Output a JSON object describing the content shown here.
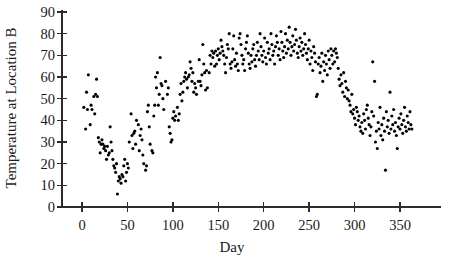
{
  "chart_data": {
    "type": "scatter",
    "title": "",
    "xlabel": "Day",
    "ylabel": "Temperature at Location B",
    "xlim": [
      -8,
      372
    ],
    "ylim": [
      0,
      93
    ],
    "grid": false,
    "legend": null,
    "marker": {
      "shape": "circle",
      "color": "#000000",
      "size_px": 3.1
    },
    "xticks": [
      0,
      50,
      100,
      150,
      200,
      250,
      300,
      350
    ],
    "xtick_labels": [
      "0",
      "50",
      "100",
      "150",
      "200",
      "250",
      "300",
      "350"
    ],
    "yticks": [
      0,
      10,
      20,
      30,
      40,
      50,
      60,
      70,
      80,
      90
    ],
    "ytick_labels": [
      "0",
      "10",
      "20",
      "30",
      "40",
      "50",
      "60",
      "70",
      "80",
      "90"
    ],
    "series": [
      {
        "name": "Temperature at Location B",
        "x": [
          2,
          4,
          5,
          6,
          7,
          9,
          10,
          11,
          13,
          14,
          15,
          16,
          17,
          18,
          19,
          20,
          21,
          22,
          23,
          24,
          25,
          26,
          27,
          28,
          29,
          30,
          31,
          32,
          33,
          34,
          35,
          36,
          37,
          38,
          39,
          40,
          41,
          42,
          43,
          44,
          45,
          46,
          47,
          48,
          49,
          50,
          51,
          52,
          54,
          55,
          56,
          57,
          58,
          59,
          60,
          62,
          63,
          64,
          65,
          66,
          67,
          68,
          70,
          71,
          72,
          73,
          74,
          75,
          77,
          78,
          79,
          80,
          81,
          82,
          83,
          84,
          85,
          86,
          87,
          88,
          89,
          90,
          92,
          94,
          95,
          96,
          97,
          98,
          99,
          100,
          101,
          102,
          103,
          105,
          106,
          107,
          108,
          109,
          110,
          111,
          112,
          113,
          114,
          115,
          116,
          117,
          118,
          119,
          120,
          121,
          122,
          123,
          124,
          125,
          126,
          128,
          129,
          130,
          131,
          132,
          133,
          134,
          135,
          136,
          137,
          138,
          140,
          141,
          142,
          143,
          144,
          145,
          146,
          147,
          148,
          149,
          150,
          151,
          152,
          153,
          154,
          155,
          156,
          157,
          158,
          159,
          160,
          161,
          162,
          163,
          164,
          165,
          166,
          167,
          168,
          169,
          170,
          171,
          172,
          173,
          174,
          175,
          176,
          177,
          178,
          179,
          180,
          181,
          182,
          183,
          184,
          185,
          186,
          187,
          188,
          189,
          190,
          191,
          192,
          193,
          194,
          195,
          196,
          197,
          198,
          199,
          200,
          201,
          202,
          203,
          204,
          205,
          206,
          207,
          208,
          209,
          210,
          211,
          212,
          213,
          214,
          215,
          216,
          217,
          218,
          219,
          220,
          221,
          222,
          223,
          224,
          225,
          226,
          227,
          228,
          229,
          230,
          231,
          232,
          233,
          234,
          235,
          236,
          237,
          238,
          239,
          240,
          241,
          242,
          243,
          244,
          245,
          246,
          247,
          248,
          249,
          250,
          251,
          252,
          253,
          254,
          255,
          256,
          257,
          258,
          259,
          260,
          261,
          262,
          263,
          264,
          265,
          266,
          267,
          268,
          269,
          270,
          271,
          272,
          273,
          274,
          275,
          276,
          277,
          278,
          279,
          280,
          281,
          282,
          283,
          284,
          285,
          286,
          287,
          288,
          289,
          290,
          291,
          292,
          293,
          294,
          295,
          296,
          297,
          298,
          299,
          300,
          301,
          302,
          303,
          304,
          305,
          306,
          307,
          308,
          309,
          310,
          311,
          312,
          313,
          314,
          315,
          316,
          317,
          318,
          319,
          320,
          321,
          322,
          323,
          324,
          325,
          326,
          327,
          328,
          329,
          330,
          331,
          332,
          333,
          334,
          335,
          336,
          337,
          338,
          339,
          340,
          341,
          342,
          343,
          344,
          345,
          346,
          347,
          348,
          349,
          350,
          351,
          352,
          353,
          354,
          355,
          356,
          357,
          358,
          359,
          360,
          361,
          362,
          363
        ],
        "y": [
          46,
          36,
          53,
          45,
          61,
          38,
          47,
          45,
          51,
          43,
          52,
          59,
          51,
          32,
          30,
          25,
          29,
          31,
          29,
          27,
          28,
          26,
          22,
          28,
          24,
          25,
          37,
          30,
          26,
          22,
          19,
          18,
          16,
          20,
          6,
          12,
          14,
          13,
          11,
          15,
          14,
          19,
          22,
          12,
          16,
          20,
          18,
          30,
          43,
          33,
          27,
          34,
          35,
          29,
          40,
          38,
          26,
          33,
          36,
          31,
          24,
          20,
          17,
          19,
          44,
          47,
          37,
          29,
          26,
          25,
          42,
          47,
          60,
          55,
          62,
          47,
          52,
          69,
          57,
          56,
          50,
          45,
          58,
          52,
          55,
          37,
          34,
          30,
          31,
          41,
          44,
          40,
          42,
          46,
          40,
          43,
          52,
          57,
          49,
          53,
          58,
          60,
          62,
          59,
          55,
          60,
          61,
          67,
          64,
          58,
          62,
          53,
          57,
          55,
          52,
          58,
          68,
          58,
          56,
          61,
          75,
          66,
          62,
          54,
          63,
          55,
          62,
          70,
          66,
          72,
          69,
          71,
          65,
          72,
          66,
          70,
          73,
          68,
          71,
          77,
          74,
          72,
          70,
          66,
          62,
          69,
          75,
          73,
          80,
          66,
          64,
          67,
          73,
          79,
          68,
          65,
          71,
          66,
          63,
          78,
          80,
          75,
          70,
          66,
          68,
          63,
          73,
          76,
          79,
          71,
          66,
          64,
          70,
          67,
          73,
          75,
          68,
          65,
          70,
          76,
          72,
          68,
          80,
          74,
          70,
          67,
          72,
          78,
          69,
          66,
          76,
          71,
          73,
          68,
          80,
          75,
          70,
          72,
          66,
          74,
          79,
          76,
          70,
          73,
          68,
          81,
          76,
          72,
          69,
          74,
          80,
          71,
          77,
          73,
          83,
          76,
          70,
          74,
          79,
          72,
          75,
          82,
          77,
          71,
          69,
          74,
          78,
          72,
          76,
          70,
          73,
          80,
          75,
          71,
          68,
          73,
          77,
          66,
          72,
          69,
          63,
          74,
          71,
          67,
          51,
          52,
          66,
          69,
          62,
          65,
          71,
          58,
          67,
          63,
          70,
          66,
          61,
          72,
          68,
          64,
          73,
          70,
          66,
          72,
          67,
          73,
          71,
          69,
          64,
          59,
          56,
          61,
          57,
          53,
          62,
          51,
          58,
          55,
          50,
          54,
          49,
          47,
          44,
          52,
          43,
          45,
          41,
          38,
          46,
          44,
          40,
          42,
          37,
          35,
          39,
          34,
          43,
          40,
          36,
          45,
          47,
          41,
          38,
          33,
          37,
          44,
          67,
          42,
          58,
          30,
          35,
          27,
          39,
          36,
          46,
          33,
          38,
          31,
          41,
          35,
          17,
          44,
          37,
          40,
          34,
          53,
          36,
          42,
          38,
          45,
          35,
          39,
          33,
          27,
          37,
          41,
          36,
          43,
          38,
          34,
          40,
          46,
          37,
          35,
          42,
          39,
          36,
          44,
          38,
          36
        ]
      }
    ]
  },
  "axes": {
    "y_title": "Temperature at Location B",
    "x_title": "Day"
  }
}
